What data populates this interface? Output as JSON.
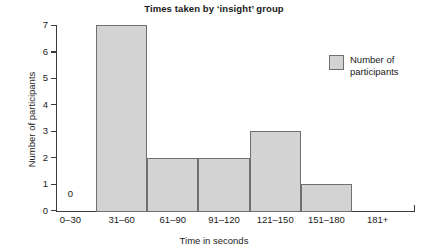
{
  "chart_data": {
    "type": "bar",
    "title": "Times taken by ‘insight’ group",
    "xlabel": "Time in seconds",
    "ylabel": "Number of participants",
    "categories": [
      "0–30",
      "31–60",
      "61–90",
      "91–120",
      "121–150",
      "151–180",
      "181+"
    ],
    "values": [
      0,
      7,
      2,
      2,
      3,
      1,
      0
    ],
    "series": [
      {
        "name": "Number of participants",
        "values": [
          0,
          7,
          2,
          2,
          3,
          1,
          0
        ]
      }
    ],
    "ylim": [
      0,
      7
    ],
    "yticks": [
      "0",
      "1",
      "2",
      "3",
      "4",
      "5",
      "6",
      "7"
    ],
    "grid": false,
    "legend": {
      "position": "top-right",
      "entries": [
        {
          "label": "Number of participants",
          "color": "#d3d3d3"
        }
      ]
    },
    "annotations": [
      {
        "text": "0",
        "category": "0–30",
        "note": "zero-count data label above empty first bin"
      }
    ],
    "bar_style": {
      "fill": "#d3d3d3",
      "stroke": "#6f6f6f",
      "contiguous": true
    },
    "axis_color": "#3b3b3b",
    "background": "#ffffff"
  }
}
